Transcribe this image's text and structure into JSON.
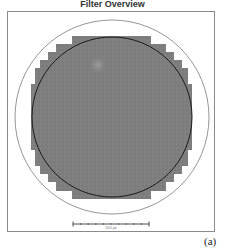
{
  "title": "Filter Overview",
  "panel_label": "(a)",
  "scale_bar": {
    "label": "1000 µm"
  },
  "colors": {
    "frame": "#8a8a8a",
    "outer_circle": "#8a8a8a",
    "inner_circle": "#1a1a1a",
    "tile_fill": "#7d7d7d",
    "highlight": "#a0a0a0",
    "background": "#ffffff"
  },
  "geometry": {
    "frame": {
      "x": 7,
      "y": 11,
      "width": 208,
      "height": 221
    },
    "center": {
      "x": 112,
      "y": 117
    },
    "outer_radius": 97,
    "inner_radius": 80
  },
  "icons": {
    "scale_bar": "scale-bar-icon"
  }
}
